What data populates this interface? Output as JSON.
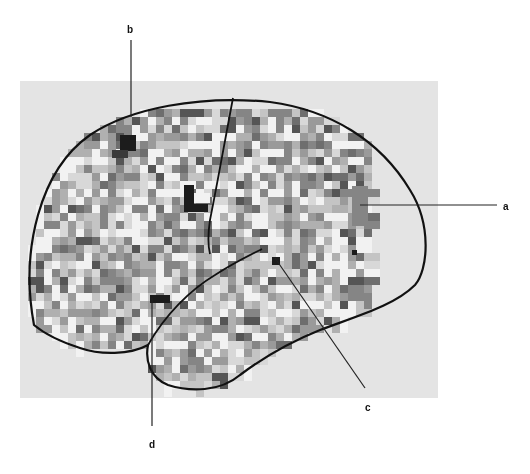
{
  "figure": {
    "type": "brain-map-lateral-view",
    "panel": {
      "x": 20,
      "y": 81,
      "width": 418,
      "height": 317,
      "color": "#e4e4e4"
    },
    "mosaic": {
      "cell": 8,
      "region_center": [
        215,
        240
      ],
      "region_rx": 182,
      "region_ry": 118,
      "palette": [
        "#f2f2f2",
        "#d8d8d8",
        "#c4c4c4",
        "#b0b0b0",
        "#9a9a9a",
        "#858585",
        "#6e6e6e",
        "#555555",
        "#3a3a3a",
        "#1c1c1c"
      ],
      "highlights": [
        {
          "x": 120,
          "y": 135,
          "w": 16,
          "h": 16,
          "shade": 9
        },
        {
          "x": 112,
          "y": 150,
          "w": 16,
          "h": 8,
          "shade": 8
        },
        {
          "x": 184,
          "y": 185,
          "w": 10,
          "h": 20,
          "shade": 9
        },
        {
          "x": 184,
          "y": 204,
          "w": 24,
          "h": 8,
          "shade": 9
        },
        {
          "x": 194,
          "y": 193,
          "w": 16,
          "h": 10,
          "shade": 0
        },
        {
          "x": 150,
          "y": 295,
          "w": 20,
          "h": 8,
          "shade": 9
        },
        {
          "x": 272,
          "y": 257,
          "w": 8,
          "h": 8,
          "shade": 9
        },
        {
          "x": 352,
          "y": 250,
          "w": 5,
          "h": 5,
          "shade": 9
        },
        {
          "x": 352,
          "y": 186,
          "w": 16,
          "h": 40,
          "shade": 5
        }
      ]
    },
    "labels": [
      {
        "id": "a",
        "text": "a",
        "x": 503,
        "y": 202
      },
      {
        "id": "b",
        "text": "b",
        "x": 127,
        "y": 25
      },
      {
        "id": "c",
        "text": "c",
        "x": 365,
        "y": 403
      },
      {
        "id": "d",
        "text": "d",
        "x": 149,
        "y": 440
      }
    ],
    "leader_lines": [
      {
        "to": "a",
        "x1": 360,
        "y1": 205,
        "x2": 497,
        "y2": 205
      },
      {
        "to": "b",
        "x1": 131,
        "y1": 40,
        "x2": 131,
        "y2": 117
      },
      {
        "to": "c",
        "x1": 275,
        "y1": 258,
        "x2": 365,
        "y2": 388
      },
      {
        "to": "d",
        "x1": 152,
        "y1": 298,
        "x2": 152,
        "y2": 426
      }
    ],
    "outlines": {
      "brain": "M 34 325 C 20 250, 40 170, 90 135 C 130 108, 200 95, 270 102 C 330 110, 380 140, 410 190 C 432 225, 428 270, 415 285 C 395 305, 360 315, 320 330 C 290 342, 260 360, 240 375 C 220 392, 190 392, 168 385 C 150 378, 145 360, 148 345 C 130 355, 100 355, 80 348 C 55 340, 40 330, 34 325 Z",
      "sylvian_fissure": "M 148 345 C 165 315, 190 290, 215 275 C 235 262, 250 255, 262 249",
      "central_sulcus": "M 233 98 C 225 140, 218 180, 210 220 C 207 240, 209 250, 210 254",
      "parietal_lower": "M 148 345 C 150 330, 158 320, 170 312"
    }
  }
}
